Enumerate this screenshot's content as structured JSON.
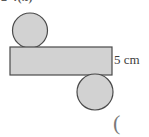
{
  "figure": {
    "top_text_fragment": "2  4(x)",
    "dimension_label": "5 cm",
    "trailing_paren": "(",
    "colors": {
      "background": "#ffffff",
      "shape_fill": "#d2d2d2",
      "shape_stroke": "#4a4a4a",
      "text": "#3d3d3d"
    },
    "shapes": [
      {
        "name": "top-left-circle",
        "type": "circle",
        "cx": 30,
        "cy": 30.5,
        "r": 17.5
      },
      {
        "name": "rectangle",
        "type": "rect",
        "x": 10,
        "y": 47,
        "width": 102,
        "height": 28,
        "label": "5 cm"
      },
      {
        "name": "bottom-right-circle",
        "type": "circle",
        "cx": 95,
        "cy": 92,
        "r": 18
      }
    ]
  }
}
